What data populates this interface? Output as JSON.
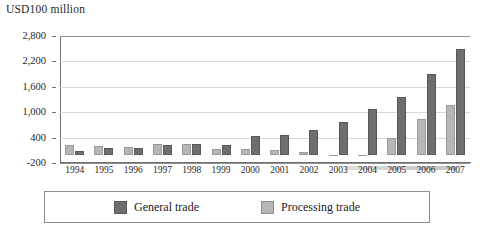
{
  "chart_data": {
    "type": "bar",
    "title": "",
    "ylabel": "USD100 million",
    "xlabel": "",
    "ylim": [
      -200,
      2800
    ],
    "yticks": [
      "2,800",
      "2,200",
      "1,600",
      "1,000",
      "400",
      "-200"
    ],
    "ytick_values": [
      2800,
      2200,
      1600,
      1000,
      400,
      -200
    ],
    "grid": true,
    "legend_position": "bottom",
    "categories": [
      "1994",
      "1995",
      "1996",
      "1997",
      "1998",
      "1999",
      "2000",
      "2001",
      "2002",
      "2003",
      "2004",
      "2005",
      "2006",
      "2007"
    ],
    "series": [
      {
        "name": "Processing trade",
        "color": "#b6b6b6",
        "values": [
          215,
          205,
          180,
          260,
          250,
          130,
          120,
          100,
          60,
          -30,
          -30,
          380,
          830,
          1180
        ]
      },
      {
        "name": "General trade",
        "color": "#6e6e6e",
        "values": [
          85,
          150,
          165,
          215,
          250,
          215,
          430,
          470,
          570,
          780,
          1080,
          1350,
          1900,
          2500
        ]
      }
    ]
  },
  "axis": {
    "y_title": "USD100 million"
  },
  "legend": {
    "items": [
      {
        "label": "General trade",
        "swatch": "general-swatch"
      },
      {
        "label": "Processing trade",
        "swatch": "processing-swatch"
      }
    ]
  }
}
